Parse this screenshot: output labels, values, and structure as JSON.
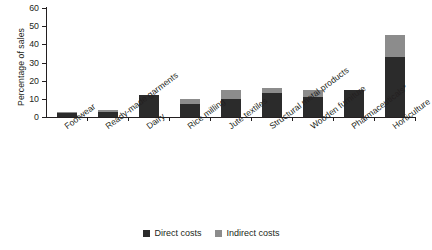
{
  "chart_data": {
    "type": "bar",
    "title": "",
    "subtitle": "",
    "xlabel": "",
    "ylabel": "Percentage of sales",
    "ylim": [
      0,
      60
    ],
    "yticks": [
      0,
      10,
      20,
      30,
      40,
      50,
      60
    ],
    "ytick_labels": [
      "0",
      "10",
      "20",
      "30",
      "40",
      "50",
      "60"
    ],
    "grid": false,
    "stacked": true,
    "legend_position": "bottom-center",
    "categories": [
      "Footwear",
      "Ready-made garments",
      "Dairy",
      "Rice milling",
      "Jute textiles",
      "Structural metal products",
      "Wooden furniture",
      "Pharmaceuticals*",
      "Horticulture"
    ],
    "series": [
      {
        "name": "Direct costs",
        "color": "#2b2b2b",
        "values": [
          2,
          2.5,
          12,
          7,
          10,
          13,
          11,
          15,
          33
        ]
      },
      {
        "name": "Indirect costs",
        "color": "#8c8c8c",
        "values": [
          1,
          1.5,
          0,
          3,
          5,
          3,
          4,
          0,
          12
        ]
      }
    ],
    "totals": [
      3,
      4,
      12,
      10,
      15,
      16,
      15,
      15,
      45
    ]
  },
  "legend": {
    "items": [
      {
        "label": "Direct costs",
        "color": "#2b2b2b"
      },
      {
        "label": "Indirect costs",
        "color": "#8c8c8c"
      }
    ]
  },
  "axis": {
    "y_title": "Percentage of sales"
  }
}
